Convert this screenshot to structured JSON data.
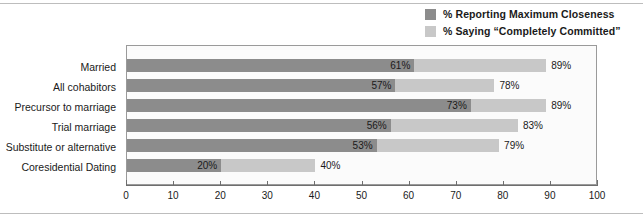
{
  "chart_data": {
    "type": "bar",
    "orientation": "horizontal",
    "title": "",
    "subtitle": "",
    "xlabel": "",
    "ylabel": "",
    "xlim": [
      0,
      100
    ],
    "xticks": [
      0,
      10,
      20,
      30,
      40,
      50,
      60,
      70,
      80,
      90,
      100
    ],
    "xtick_labels": [
      "0",
      "10",
      "20",
      "30",
      "40",
      "50",
      "60",
      "70",
      "80",
      "90",
      "100"
    ],
    "grid": false,
    "legend_position": "top-right",
    "categories": [
      "Married",
      "All cohabitors",
      "Precursor to marriage",
      "Trial marriage",
      "Substitute or alternative",
      "Coresidential Dating"
    ],
    "series": [
      {
        "name": "% Reporting Maximum Closeness",
        "color": "#8c8c8c",
        "values": [
          61,
          57,
          73,
          56,
          53,
          20
        ],
        "value_labels": [
          "61%",
          "57%",
          "73%",
          "56%",
          "53%",
          "20%"
        ]
      },
      {
        "name": "% Saying “Completely Committed”",
        "color": "#c8c8c8",
        "values": [
          89,
          78,
          89,
          83,
          79,
          40
        ],
        "value_labels": [
          "89%",
          "78%",
          "89%",
          "83%",
          "79%",
          "40%"
        ]
      }
    ]
  },
  "legend": {
    "items": [
      {
        "label": "% Reporting Maximum Closeness",
        "color": "#8c8c8c"
      },
      {
        "label": "% Saying “Completely Committed”",
        "color": "#c8c8c8"
      }
    ]
  }
}
